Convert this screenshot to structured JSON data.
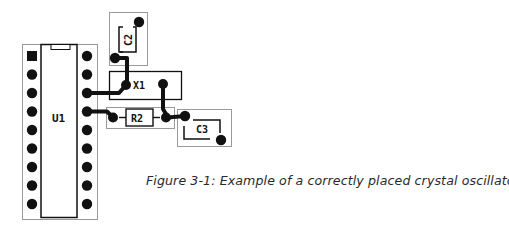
{
  "figure": {
    "caption": "Figure 3-1:  Example of a correctly placed crystal oscillator",
    "colors": {
      "ink": "#111111",
      "outline": "#9a9a9a",
      "background": "#ffffff",
      "caption": "#2a2a2a"
    }
  },
  "components": {
    "u1": {
      "label": "U1",
      "type": "DIP-18 IC",
      "pins_per_side": 9
    },
    "c2": {
      "label": "C2",
      "type": "capacitor"
    },
    "x1": {
      "label": "X1",
      "type": "crystal oscillator"
    },
    "r2": {
      "label": "R2",
      "type": "resistor"
    },
    "c3": {
      "label": "C3",
      "type": "capacitor"
    }
  }
}
